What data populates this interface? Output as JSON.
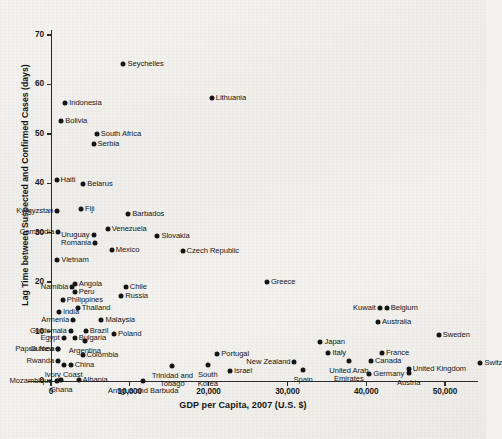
{
  "chart_data": {
    "type": "scatter",
    "title": "",
    "xlabel": "GDP per Capita, 2007 (U.S. $)",
    "ylabel": "Lag Time between Suspected and Confirmed Cases (days)",
    "xlim": [
      -2900,
      55200
    ],
    "ylim": [
      -2.2,
      73.5
    ],
    "xticks": [
      0,
      10000,
      20000,
      30000,
      40000,
      50000
    ],
    "xtick_labels": [
      "0",
      "10,000",
      "20,000",
      "30,000",
      "40,000",
      "50,000"
    ],
    "yticks": [
      0,
      10,
      20,
      30,
      40,
      50,
      60,
      70
    ],
    "ytick_labels": [
      "0",
      "10",
      "20",
      "30",
      "40",
      "50",
      "60",
      "70"
    ],
    "grid": false,
    "legend": "none",
    "marker_color": "#151515",
    "points": [
      {
        "label": "Seychelles",
        "x": 9200,
        "y": 64.2,
        "lx": 0.5,
        "ly": 0.5,
        "pos": "r"
      },
      {
        "label": "Lithuania",
        "x": 20400,
        "y": 57.3,
        "lx": 0.5,
        "ly": 0.5,
        "pos": "r"
      },
      {
        "label": "Indonesia",
        "x": 1800,
        "y": 56.3,
        "lx": 0.5,
        "ly": 0.5,
        "pos": "r"
      },
      {
        "label": "Bolivia",
        "x": 1300,
        "y": 52.7,
        "lx": 0.5,
        "ly": 0.5,
        "pos": "r"
      },
      {
        "label": "South Africa",
        "x": 5800,
        "y": 49.9,
        "lx": 0.5,
        "ly": 0.5,
        "pos": "r"
      },
      {
        "label": "Serbia",
        "x": 5400,
        "y": 47.9,
        "lx": 0.5,
        "ly": 0.5,
        "pos": "r"
      },
      {
        "label": "Haiti",
        "x": 700,
        "y": 40.6,
        "lx": 0.5,
        "ly": 0.5,
        "pos": "r"
      },
      {
        "label": "Belarus",
        "x": 4100,
        "y": 39.9,
        "lx": 0.5,
        "ly": 0.5,
        "pos": "r"
      },
      {
        "label": "Kyrgyzstan",
        "x": 800,
        "y": 34.4,
        "lx": -0.5,
        "ly": -0.5,
        "pos": "l"
      },
      {
        "label": "Fiji",
        "x": 3800,
        "y": 34.7,
        "lx": 0.5,
        "ly": 0.5,
        "pos": "r"
      },
      {
        "label": "Barbados",
        "x": 9800,
        "y": 33.7,
        "lx": 0.5,
        "ly": 0.5,
        "pos": "r"
      },
      {
        "label": "Venezuela",
        "x": 7200,
        "y": 30.7,
        "lx": 0.5,
        "ly": 0.5,
        "pos": "r"
      },
      {
        "label": "Cambodia",
        "x": 900,
        "y": 30.1,
        "lx": -0.5,
        "ly": -0.5,
        "pos": "l"
      },
      {
        "label": "Uruguay",
        "x": 5400,
        "y": 29.6,
        "lx": -0.5,
        "ly": 0.5,
        "pos": "l"
      },
      {
        "label": "Slovakia",
        "x": 13500,
        "y": 29.3,
        "lx": 0.5,
        "ly": 0.5,
        "pos": "r"
      },
      {
        "label": "Romania",
        "x": 5600,
        "y": 28.0,
        "lx": -0.5,
        "ly": 0.5,
        "pos": "l"
      },
      {
        "label": "Mexico",
        "x": 7700,
        "y": 26.5,
        "lx": 0.5,
        "ly": 0.5,
        "pos": "r"
      },
      {
        "label": "Czech Republic",
        "x": 16700,
        "y": 26.4,
        "lx": 0.5,
        "ly": 0.5,
        "pos": "r"
      },
      {
        "label": "Vietnam",
        "x": 800,
        "y": 24.5,
        "lx": 0.5,
        "ly": 0.5,
        "pos": "r"
      },
      {
        "label": "Greece",
        "x": 27400,
        "y": 20.0,
        "lx": 0.5,
        "ly": 0.5,
        "pos": "r"
      },
      {
        "label": "Angola",
        "x": 3000,
        "y": 19.6,
        "lx": 0.5,
        "ly": -0.5,
        "pos": "r"
      },
      {
        "label": "Namibia",
        "x": 2700,
        "y": 19.1,
        "lx": -0.5,
        "ly": -0.5,
        "pos": "l"
      },
      {
        "label": "Chile",
        "x": 9500,
        "y": 19.0,
        "lx": 0.5,
        "ly": 0.5,
        "pos": "r"
      },
      {
        "label": "Peru",
        "x": 3000,
        "y": 18.0,
        "lx": 0.5,
        "ly": 0.5,
        "pos": "r"
      },
      {
        "label": "Russia",
        "x": 8900,
        "y": 17.2,
        "lx": 0.5,
        "ly": 0.5,
        "pos": "r"
      },
      {
        "label": "Philippines",
        "x": 1500,
        "y": 16.4,
        "lx": 0.5,
        "ly": 0.5,
        "pos": "r"
      },
      {
        "label": "Thailand",
        "x": 3400,
        "y": 14.8,
        "lx": 0.5,
        "ly": 0.5,
        "pos": "r"
      },
      {
        "label": "India",
        "x": 1000,
        "y": 14.0,
        "lx": 0.5,
        "ly": -0.5,
        "pos": "r"
      },
      {
        "label": "Armenia",
        "x": 2800,
        "y": 12.4,
        "lx": -0.5,
        "ly": -0.5,
        "pos": "l"
      },
      {
        "label": "Malaysia",
        "x": 6400,
        "y": 12.4,
        "lx": 0.5,
        "ly": 0.5,
        "pos": "r"
      },
      {
        "label": "Kuwait",
        "x": 41700,
        "y": 14.7,
        "lx": -0.5,
        "ly": 0.5,
        "pos": "l"
      },
      {
        "label": "Belgium",
        "x": 42600,
        "y": 14.7,
        "lx": 0.5,
        "ly": 0.5,
        "pos": "r"
      },
      {
        "label": "Australia",
        "x": 41500,
        "y": 11.9,
        "lx": 0.5,
        "ly": 0.5,
        "pos": "r"
      },
      {
        "label": "Sweden",
        "x": 49200,
        "y": 9.4,
        "lx": 0.5,
        "ly": 0.5,
        "pos": "r"
      },
      {
        "label": "Guatemala",
        "x": 2500,
        "y": 10.2,
        "lx": -0.5,
        "ly": -0.5,
        "pos": "l"
      },
      {
        "label": "Brazil",
        "x": 4400,
        "y": 10.2,
        "lx": 0.5,
        "ly": 0.5,
        "pos": "r"
      },
      {
        "label": "Poland",
        "x": 8000,
        "y": 9.5,
        "lx": 0.5,
        "ly": 0.5,
        "pos": "r"
      },
      {
        "label": "Bulgaria",
        "x": 3000,
        "y": 8.8,
        "lx": 0.5,
        "ly": 0.5,
        "pos": "r"
      },
      {
        "label": "Egypt",
        "x": 1600,
        "y": 8.6,
        "lx": -0.5,
        "ly": 0.5,
        "pos": "l"
      },
      {
        "label": "Argentina",
        "x": 4300,
        "y": 8.0,
        "lx": 0.5,
        "ly": -0.5,
        "pos": "c"
      },
      {
        "label": "Japan",
        "x": 34200,
        "y": 7.8,
        "lx": 0.5,
        "ly": 0.5,
        "pos": "r"
      },
      {
        "label": "Guinea",
        "x": 900,
        "y": 6.5,
        "lx": -0.5,
        "ly": -0.5,
        "pos": "l"
      },
      {
        "label": "Papua New Guinea",
        "x": 900,
        "y": 6.5,
        "lx": -0.5,
        "ly": 0.5,
        "pos": "l"
      },
      {
        "label": "Italy",
        "x": 35200,
        "y": 5.7,
        "lx": 0.5,
        "ly": 0.5,
        "pos": "r"
      },
      {
        "label": "France",
        "x": 42000,
        "y": 5.6,
        "lx": 0.5,
        "ly": 0.5,
        "pos": "r"
      },
      {
        "label": "Portugal",
        "x": 21100,
        "y": 5.5,
        "lx": 0.5,
        "ly": 0.5,
        "pos": "r"
      },
      {
        "label": "Colombia",
        "x": 4000,
        "y": 5.3,
        "lx": 0.5,
        "ly": 0.5,
        "pos": "r"
      },
      {
        "label": "Rwanda",
        "x": 900,
        "y": 4.0,
        "lx": -0.5,
        "ly": -0.5,
        "pos": "l"
      },
      {
        "label": "Canada",
        "x": 40600,
        "y": 4.0,
        "lx": 0.5,
        "ly": 0.5,
        "pos": "r"
      },
      {
        "label": "United Arab Emirates",
        "x": 37800,
        "y": 4.1,
        "lx": 0.5,
        "ly": -0.5,
        "pos": "c"
      },
      {
        "label": "New Zealand",
        "x": 30900,
        "y": 3.9,
        "lx": -0.5,
        "ly": 0.5,
        "pos": "l"
      },
      {
        "label": "South Korea",
        "x": 19900,
        "y": 3.2,
        "lx": 0.5,
        "ly": -0.5,
        "pos": "c"
      },
      {
        "label": "Trinidad and Tobago",
        "x": 15400,
        "y": 3.1,
        "lx": 0.5,
        "ly": -0.5,
        "pos": "c"
      },
      {
        "label": "China",
        "x": 2500,
        "y": 3.3,
        "lx": 0.5,
        "ly": 0.5,
        "pos": "r"
      },
      {
        "label": "Ivory Coast",
        "x": 1600,
        "y": 3.3,
        "lx": 0.5,
        "ly": -0.5,
        "pos": "c"
      },
      {
        "label": "Israel",
        "x": 22700,
        "y": 2.1,
        "lx": 0.5,
        "ly": 0.5,
        "pos": "r"
      },
      {
        "label": "Spain",
        "x": 32000,
        "y": 2.3,
        "lx": 0.5,
        "ly": -0.5,
        "pos": "c"
      },
      {
        "label": "United Kingdom",
        "x": 45400,
        "y": 2.4,
        "lx": 0.5,
        "ly": 0.5,
        "pos": "r"
      },
      {
        "label": "Austria",
        "x": 45400,
        "y": 1.6,
        "lx": 0.5,
        "ly": -0.5,
        "pos": "c"
      },
      {
        "label": "Germany",
        "x": 40400,
        "y": 1.4,
        "lx": 0.5,
        "ly": 0.5,
        "pos": "r"
      },
      {
        "label": "Switzerland",
        "x": 54500,
        "y": 3.6,
        "lx": 0.5,
        "ly": 0.5,
        "pos": "r"
      },
      {
        "label": "Albania",
        "x": 3500,
        "y": 0.3,
        "lx": 0.5,
        "ly": 0.5,
        "pos": "r"
      },
      {
        "label": "Ghana",
        "x": 1300,
        "y": 0.2,
        "lx": 0.5,
        "ly": -0.5,
        "pos": "c"
      },
      {
        "label": "Mozambique",
        "x": 700,
        "y": 0.1,
        "lx": -0.5,
        "ly": -0.5,
        "pos": "l"
      },
      {
        "label": "Antigua and Barbuda",
        "x": 11700,
        "y": 0.1,
        "lx": 0.5,
        "ly": -0.5,
        "pos": "c"
      }
    ]
  }
}
